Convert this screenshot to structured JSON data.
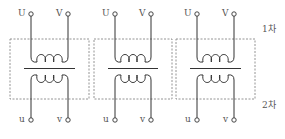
{
  "diagram": {
    "type": "transformer-bank",
    "units": [
      {
        "primary": [
          "U",
          "V"
        ],
        "secondary": [
          "u",
          "v"
        ]
      },
      {
        "primary": [
          "U",
          "V"
        ],
        "secondary": [
          "u",
          "v"
        ]
      },
      {
        "primary": [
          "U",
          "V"
        ],
        "secondary": [
          "u",
          "v"
        ]
      }
    ],
    "side_labels": {
      "primary": "1차",
      "secondary": "2차"
    }
  },
  "colors": {
    "line": "#333333",
    "dash": "#888888",
    "text": "#555555"
  }
}
